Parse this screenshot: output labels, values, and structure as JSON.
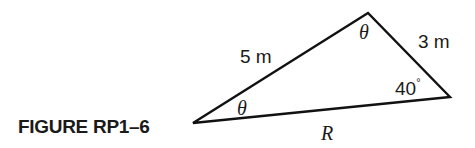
{
  "figure": {
    "caption": "FIGURE RP1–6",
    "stroke_color": "#111111",
    "vertices": {
      "left": [
        193,
        123
      ],
      "top": [
        368,
        13
      ],
      "right": [
        450,
        97
      ]
    },
    "labels": {
      "side_left_top": "5 m",
      "side_top_right": "3 m",
      "side_bottom": "R",
      "angle_top": "θ",
      "angle_left": "θ",
      "angle_right_value": "40",
      "angle_right_unit": "°"
    }
  }
}
